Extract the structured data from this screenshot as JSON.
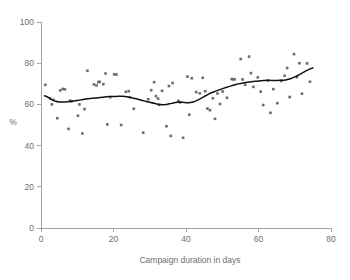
{
  "chart_data": {
    "type": "scatter",
    "title": "",
    "subtitle": "",
    "xlabel": "Campaign duration in days",
    "ylabel": "%",
    "xlim": [
      0,
      80
    ],
    "ylim": [
      0,
      100
    ],
    "xticks": [
      0,
      20,
      40,
      60,
      80
    ],
    "yticks": [
      0,
      20,
      40,
      60,
      80,
      100
    ],
    "xtick_labels": [
      "0",
      "20",
      "40",
      "60",
      "80"
    ],
    "ytick_labels": [
      "0",
      "20",
      "40",
      "60",
      "80",
      "100"
    ],
    "grid": false,
    "legend": null,
    "legend_position": "none",
    "annotations": [],
    "marker_color": "#6b6b6b",
    "marker_shape": "square",
    "line_color": "#111111",
    "axis_color": "#9a9a9a",
    "text_color": "#6e6e6e",
    "background_color": "#ffffff",
    "series": [
      {
        "name": "Observations",
        "type": "scatter",
        "points": [
          [
            1.2,
            69.5
          ],
          [
            2.5,
            63.0
          ],
          [
            3.0,
            60.0
          ],
          [
            3.4,
            62.2
          ],
          [
            4.5,
            53.3
          ],
          [
            5.3,
            66.8
          ],
          [
            6.0,
            67.5
          ],
          [
            6.6,
            67.3
          ],
          [
            7.6,
            48.1
          ],
          [
            8.0,
            61.8
          ],
          [
            8.4,
            61.5
          ],
          [
            10.2,
            54.5
          ],
          [
            10.6,
            60.0
          ],
          [
            11.4,
            45.9
          ],
          [
            12.0,
            57.7
          ],
          [
            12.8,
            76.3
          ],
          [
            14.6,
            69.7
          ],
          [
            15.3,
            69.2
          ],
          [
            15.8,
            70.8
          ],
          [
            16.2,
            71.0
          ],
          [
            17.2,
            69.8
          ],
          [
            17.8,
            75.0
          ],
          [
            18.3,
            50.3
          ],
          [
            19.1,
            63.5
          ],
          [
            20.2,
            74.6
          ],
          [
            20.8,
            74.5
          ],
          [
            22.1,
            50.0
          ],
          [
            23.4,
            66.1
          ],
          [
            24.2,
            66.4
          ],
          [
            24.5,
            63.5
          ],
          [
            25.6,
            57.9
          ],
          [
            28.2,
            46.3
          ],
          [
            29.6,
            62.5
          ],
          [
            30.4,
            66.9
          ],
          [
            31.2,
            70.8
          ],
          [
            31.7,
            64.0
          ],
          [
            32.3,
            62.8
          ],
          [
            32.6,
            59.8
          ],
          [
            33.4,
            66.6
          ],
          [
            34.6,
            49.4
          ],
          [
            35.3,
            68.9
          ],
          [
            35.8,
            44.7
          ],
          [
            36.3,
            70.4
          ],
          [
            37.9,
            61.7
          ],
          [
            38.4,
            61.0
          ],
          [
            39.2,
            43.8
          ],
          [
            40.4,
            73.5
          ],
          [
            40.9,
            55.0
          ],
          [
            41.6,
            72.7
          ],
          [
            42.8,
            66.0
          ],
          [
            43.8,
            65.4
          ],
          [
            44.6,
            72.9
          ],
          [
            45.3,
            66.4
          ],
          [
            45.9,
            58.0
          ],
          [
            46.6,
            57.2
          ],
          [
            47.4,
            63.0
          ],
          [
            48.0,
            53.0
          ],
          [
            48.7,
            65.3
          ],
          [
            49.4,
            60.2
          ],
          [
            50.1,
            66.3
          ],
          [
            51.3,
            63.2
          ],
          [
            52.6,
            72.3
          ],
          [
            53.0,
            72.2
          ],
          [
            53.4,
            72.2
          ],
          [
            55.1,
            82.0
          ],
          [
            55.6,
            72.1
          ],
          [
            56.3,
            69.5
          ],
          [
            57.4,
            83.2
          ],
          [
            57.9,
            75.2
          ],
          [
            58.6,
            68.5
          ],
          [
            59.8,
            73.1
          ],
          [
            60.6,
            66.2
          ],
          [
            61.3,
            59.7
          ],
          [
            62.6,
            71.6
          ],
          [
            63.3,
            55.9
          ],
          [
            64.1,
            67.4
          ],
          [
            65.2,
            60.6
          ],
          [
            66.3,
            71.4
          ],
          [
            67.2,
            73.9
          ],
          [
            67.9,
            77.7
          ],
          [
            68.6,
            63.6
          ],
          [
            69.8,
            84.4
          ],
          [
            70.6,
            73.2
          ],
          [
            71.3,
            80.0
          ],
          [
            72.0,
            65.2
          ],
          [
            73.4,
            79.9
          ],
          [
            74.2,
            71.0
          ]
        ]
      },
      {
        "name": "Smoothed trend",
        "type": "line",
        "points": [
          [
            1.0,
            64.2
          ],
          [
            2.0,
            63.4
          ],
          [
            3.0,
            62.3
          ],
          [
            4.0,
            61.5
          ],
          [
            5.0,
            61.2
          ],
          [
            6.5,
            61.2
          ],
          [
            8.0,
            61.4
          ],
          [
            9.5,
            61.8
          ],
          [
            11.0,
            62.2
          ],
          [
            13.0,
            62.7
          ],
          [
            15.0,
            63.1
          ],
          [
            17.0,
            63.5
          ],
          [
            19.0,
            63.8
          ],
          [
            21.0,
            63.9
          ],
          [
            22.5,
            63.9
          ],
          [
            24.0,
            63.6
          ],
          [
            25.5,
            63.0
          ],
          [
            27.0,
            62.4
          ],
          [
            28.5,
            61.7
          ],
          [
            30.0,
            61.0
          ],
          [
            31.5,
            60.4
          ],
          [
            33.0,
            59.9
          ],
          [
            34.5,
            60.0
          ],
          [
            36.0,
            60.5
          ],
          [
            37.5,
            61.0
          ],
          [
            39.0,
            61.0
          ],
          [
            40.5,
            60.8
          ],
          [
            42.0,
            61.2
          ],
          [
            43.5,
            62.3
          ],
          [
            45.0,
            63.8
          ],
          [
            46.5,
            65.2
          ],
          [
            48.0,
            66.3
          ],
          [
            49.5,
            67.3
          ],
          [
            51.0,
            68.2
          ],
          [
            52.5,
            69.0
          ],
          [
            54.0,
            69.8
          ],
          [
            55.5,
            70.3
          ],
          [
            57.0,
            70.8
          ],
          [
            58.5,
            71.1
          ],
          [
            60.0,
            71.4
          ],
          [
            61.5,
            71.6
          ],
          [
            63.0,
            71.7
          ],
          [
            64.5,
            71.6
          ],
          [
            66.0,
            71.7
          ],
          [
            67.5,
            71.9
          ],
          [
            69.0,
            72.6
          ],
          [
            70.5,
            73.8
          ],
          [
            72.0,
            75.2
          ],
          [
            73.5,
            76.6
          ],
          [
            75.0,
            77.8
          ]
        ]
      }
    ]
  }
}
